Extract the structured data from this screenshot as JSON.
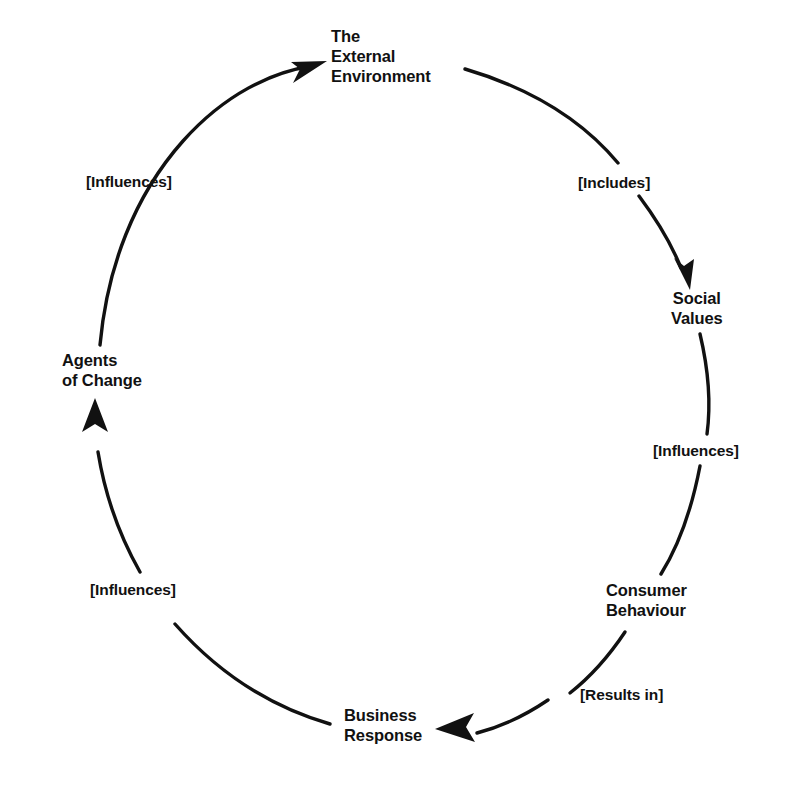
{
  "diagram": {
    "type": "cyclical-flow-diagram",
    "direction": "clockwise",
    "stroke_color": "#111111",
    "background_color": "#ffffff",
    "nodes": [
      {
        "id": "external-environment",
        "label": "The\nExternal\nEnvironment",
        "position": "top"
      },
      {
        "id": "social-values",
        "label": "Social\nValues",
        "position": "upper-right"
      },
      {
        "id": "consumer-behaviour",
        "label": "Consumer\nBehaviour",
        "position": "lower-right"
      },
      {
        "id": "business-response",
        "label": "Business\nResponse",
        "position": "bottom"
      },
      {
        "id": "agents-of-change",
        "label": "Agents\nof Change",
        "position": "left"
      }
    ],
    "edges": [
      {
        "id": "includes",
        "label": "[Includes]",
        "from": "external-environment",
        "to": "social-values"
      },
      {
        "id": "influences-right",
        "label": "[Influences]",
        "from": "social-values",
        "to": "consumer-behaviour"
      },
      {
        "id": "results-in",
        "label": "[Results in]",
        "from": "consumer-behaviour",
        "to": "business-response"
      },
      {
        "id": "influences-bottom-left",
        "label": "[Influences]",
        "from": "business-response",
        "to": "agents-of-change"
      },
      {
        "id": "influences-top-left",
        "label": "[Influences]",
        "from": "agents-of-change",
        "to": "external-environment"
      }
    ]
  }
}
